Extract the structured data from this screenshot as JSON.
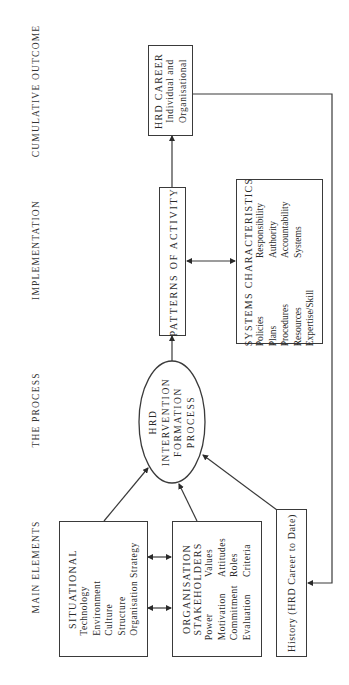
{
  "column_headers": {
    "cumulative_outcome": "CUMULATIVE OUTCOME",
    "implementation": "IMPLEMENTATION",
    "the_process": "THE PROCESS",
    "main_elements": "MAIN ELEMENTS"
  },
  "nodes": {
    "hrd_career": {
      "title": "HRD CAREER",
      "lines": [
        "Individual and",
        "Organisational"
      ]
    },
    "patterns_of_activity": {
      "title": "PATTERNS OF ACTIVITY"
    },
    "systems_characteristics": {
      "title": "SYSTEMS CHARACTERISTICS",
      "rows": [
        [
          "Policies",
          "Responsibility"
        ],
        [
          "Plans",
          "Authority"
        ],
        [
          "Procedures",
          "Accountability"
        ],
        [
          "Resources",
          "Systems"
        ],
        [
          "Expertise/Skill",
          ""
        ]
      ]
    },
    "hrd_intervention": {
      "lines": [
        "HRD",
        "INTERVENTION",
        "FORMATION",
        "PROCESS"
      ]
    },
    "situational": {
      "title": "SITUATIONAL",
      "lines": [
        "Technology",
        "Environment",
        "Culture",
        "Structure",
        "Organisation Strategy"
      ]
    },
    "organisation_stakeholders": {
      "title_lines": [
        "ORGANISATION",
        "STAKEHOLDERS"
      ],
      "rows": [
        [
          "Power",
          "Values"
        ],
        [
          "Motivation",
          "Attitudes"
        ],
        [
          "Commitment",
          "Roles"
        ],
        [
          "Evaluation",
          "Criteria"
        ]
      ]
    },
    "history": {
      "title": "History (HRD Career to Date)"
    }
  },
  "edges": [
    {
      "from": "situational",
      "to": "hrd_intervention",
      "type": "arrow"
    },
    {
      "from": "organisation_stakeholders",
      "to": "hrd_intervention",
      "type": "arrow"
    },
    {
      "from": "history",
      "to": "hrd_intervention",
      "type": "arrow"
    },
    {
      "from": "hrd_intervention",
      "to": "patterns_of_activity",
      "type": "arrow"
    },
    {
      "from": "patterns_of_activity",
      "to": "hrd_career",
      "type": "arrow"
    },
    {
      "from": "patterns_of_activity",
      "to": "systems_characteristics",
      "type": "double-arrow"
    },
    {
      "from": "situational",
      "to": "organisation_stakeholders",
      "type": "double-arrow"
    },
    {
      "from": "situational",
      "to": "organisation_stakeholders",
      "type": "double-arrow"
    },
    {
      "from": "hrd_career",
      "to": "history",
      "type": "feedback-arrow"
    }
  ],
  "colors": {
    "line": "#3a3a3a",
    "background": "#ffffff",
    "text": "#2a2a2a"
  }
}
